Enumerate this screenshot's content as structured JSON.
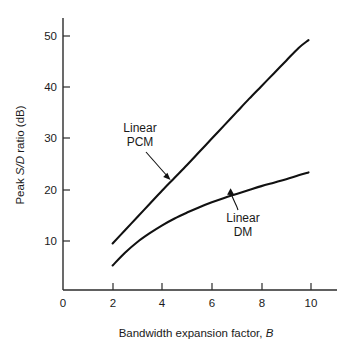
{
  "chart_data": {
    "type": "line",
    "title": "",
    "xlabel": "Bandwidth expansion factor, B",
    "xlabel_plain": "Bandwidth expansion factor, ",
    "xlabel_italic": "B",
    "ylabel": "Peak S/D ratio (dB)",
    "ylabel_part1": "Peak ",
    "ylabel_italic": "S/D",
    "ylabel_part2": " ratio (dB)",
    "xlim": [
      0,
      11
    ],
    "ylim": [
      0,
      54
    ],
    "xticks": [
      0,
      2,
      4,
      6,
      8,
      10
    ],
    "xticklabels": [
      "0",
      "2",
      "4",
      "6",
      "8",
      "10"
    ],
    "yticks": [
      10,
      20,
      30,
      40,
      50
    ],
    "yticklabels": [
      "10",
      "20",
      "30",
      "40",
      "50"
    ],
    "grid": false,
    "legend_position": "inline-annotations",
    "line_color": "#111111",
    "axis_color": "#2b2b2b",
    "background": "#ffffff",
    "series": [
      {
        "name": "Linear PCM",
        "label_line1": "Linear",
        "label_line2": "PCM",
        "x": [
          2.0,
          2.5,
          3.0,
          3.5,
          4.0,
          4.5,
          5.0,
          5.5,
          6.0,
          6.5,
          7.0,
          7.5,
          8.0,
          8.5,
          9.0,
          9.5,
          9.9
        ],
        "values": [
          9.5,
          12.2,
          14.9,
          17.6,
          20.3,
          22.9,
          25.5,
          28.2,
          30.9,
          33.6,
          36.3,
          39.0,
          41.6,
          44.2,
          46.8,
          49.4,
          51.0
        ]
      },
      {
        "name": "Linear DM",
        "label_line1": "Linear",
        "label_line2": "DM",
        "x": [
          2.0,
          2.5,
          3.0,
          3.5,
          4.0,
          4.5,
          5.0,
          5.5,
          6.0,
          6.5,
          7.0,
          7.5,
          8.0,
          8.5,
          9.0,
          9.5,
          9.9
        ],
        "values": [
          5.0,
          7.6,
          9.8,
          11.6,
          13.2,
          14.6,
          15.8,
          16.9,
          17.9,
          18.8,
          19.6,
          20.4,
          21.2,
          21.9,
          22.6,
          23.4,
          24.0
        ]
      }
    ],
    "annotations": [
      {
        "name": "linear-pcm-callout",
        "text_line1": "Linear",
        "text_line2": "PCM",
        "text_x": 3.05,
        "text_y": 31.5,
        "arrow_from_x": 3.35,
        "arrow_from_y": 26.5,
        "arrow_to_x": 4.25,
        "arrow_to_y": 21.8
      },
      {
        "name": "linear-dm-callout",
        "text_line1": "Linear",
        "text_line2": "DM",
        "text_x": 7.15,
        "text_y": 14.6,
        "arrow_from_x": 7.3,
        "arrow_from_y": 16.6,
        "arrow_to_x": 6.85,
        "arrow_to_y": 19.6
      }
    ]
  }
}
